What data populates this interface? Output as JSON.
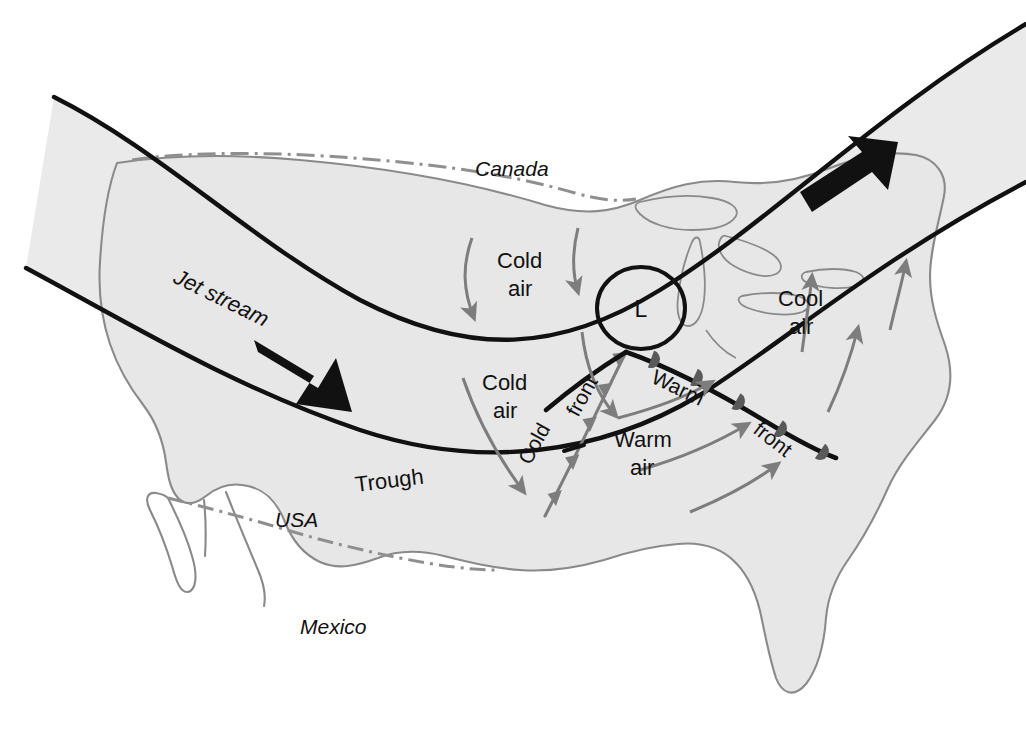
{
  "figure": {
    "type": "weather-map-diagram",
    "colors": {
      "land_fill": "#e7e7e7",
      "jet_band_fill": "#eaeaea",
      "coastline": "#8a8a8a",
      "border_dashdot": "#8f8f8f",
      "jet_stream_line": "#111111",
      "cold_front_line": "#7d7d7d",
      "warm_front_line": "#111111",
      "warm_front_bump": "#5a5a5a",
      "flow_arrow": "#7d7d7d",
      "bold_arrow": "#111111",
      "text": "#111111"
    }
  },
  "labels": {
    "canada": "Canada",
    "usa": "USA",
    "mexico": "Mexico",
    "jet_stream": "Jet stream",
    "trough": "Trough",
    "low_center": "L",
    "cold_air_north_1": "Cold",
    "cold_air_north_2": "air",
    "cold_air_south_1": "Cold",
    "cold_air_south_2": "air",
    "warm_air_1": "Warm",
    "warm_air_2": "air",
    "cool_air_1": "Cool",
    "cool_air_2": "air",
    "cold_front_a": "Cold",
    "cold_front_b": "front",
    "warm_front_a": "Warm",
    "warm_front_b": "front"
  },
  "features": [
    {
      "name": "jet-stream-band",
      "kind": "shaded-band",
      "description": "Light gray band bounded by two bold black curves sweeping from west, dipping over the central USA, then rising northeast"
    },
    {
      "name": "jet-stream-arrow-west",
      "kind": "bold-arrow",
      "direction": "southeast"
    },
    {
      "name": "jet-stream-arrow-east",
      "kind": "bold-arrow",
      "direction": "northeast"
    },
    {
      "name": "low-pressure-center",
      "kind": "circle-label",
      "value": "L"
    },
    {
      "name": "cold-front",
      "kind": "front",
      "symbol": "triangles",
      "color": "gray"
    },
    {
      "name": "warm-front",
      "kind": "front",
      "symbol": "semicircles",
      "color": "black"
    },
    {
      "name": "cold-air-flow-arrows",
      "kind": "flow-arrows",
      "count": 4,
      "direction": "southward"
    },
    {
      "name": "warm-air-flow-arrows",
      "kind": "flow-arrows",
      "count": 3,
      "direction": "northeastward"
    },
    {
      "name": "cool-air-flow-arrows",
      "kind": "flow-arrows",
      "count": 2,
      "direction": "northward"
    },
    {
      "name": "usa-canada-border",
      "kind": "dash-dot-line"
    },
    {
      "name": "usa-mexico-border",
      "kind": "dash-dot-line"
    },
    {
      "name": "great-lakes",
      "kind": "outline"
    }
  ]
}
